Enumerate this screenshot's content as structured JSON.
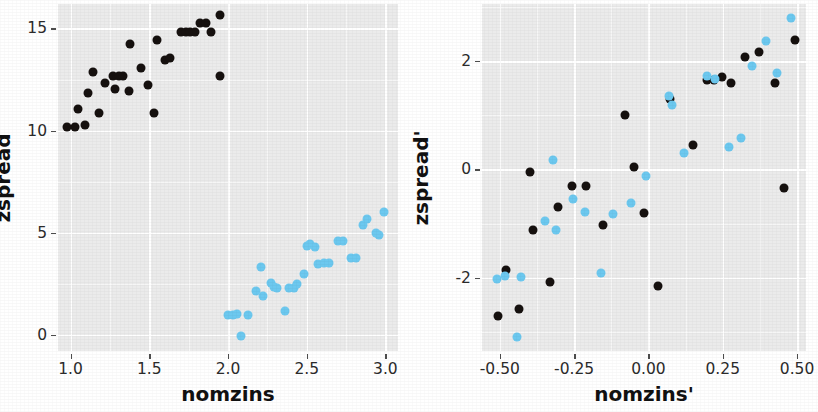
{
  "figure": {
    "background": "#ffffff",
    "panel_background": "#ebebeb",
    "grid_color": "#ffffff",
    "black_series_color": "#16110f",
    "blue_series_color": "#6cc8ef"
  },
  "chart_data": [
    {
      "type": "scatter",
      "title": "",
      "xlabel": "nomzins",
      "ylabel": "zspread",
      "xlim": [
        0.92,
        3.08
      ],
      "ylim": [
        -0.8,
        16.2
      ],
      "xticks": [
        1.0,
        1.5,
        2.0,
        2.5,
        3.0
      ],
      "xticklabels": [
        "1.0",
        "1.5",
        "2.0",
        "2.5",
        "3.0"
      ],
      "yticks": [
        0,
        5,
        10,
        15
      ],
      "yticklabels": [
        "0",
        "5",
        "10",
        "15"
      ],
      "grid": true,
      "legend": "none",
      "series": [
        {
          "name": "black-group",
          "color": "#16110f",
          "points": [
            [
              0.98,
              10.15
            ],
            [
              1.03,
              10.15
            ],
            [
              1.09,
              10.25
            ],
            [
              1.05,
              11.05
            ],
            [
              1.14,
              12.85
            ],
            [
              1.11,
              11.85
            ],
            [
              1.18,
              10.85
            ],
            [
              1.22,
              12.35
            ],
            [
              1.27,
              12.65
            ],
            [
              1.31,
              12.65
            ],
            [
              1.33,
              12.65
            ],
            [
              1.28,
              12.05
            ],
            [
              1.38,
              14.25
            ],
            [
              1.37,
              11.95
            ],
            [
              1.45,
              13.05
            ],
            [
              1.49,
              12.25
            ],
            [
              1.53,
              10.85
            ],
            [
              1.55,
              14.45
            ],
            [
              1.6,
              13.45
            ],
            [
              1.63,
              13.55
            ],
            [
              1.7,
              14.85
            ],
            [
              1.73,
              14.85
            ],
            [
              1.76,
              14.85
            ],
            [
              1.79,
              14.85
            ],
            [
              1.82,
              15.25
            ],
            [
              1.86,
              15.25
            ],
            [
              1.89,
              14.85
            ],
            [
              1.95,
              15.65
            ],
            [
              1.95,
              12.65
            ]
          ]
        },
        {
          "name": "blue-group",
          "color": "#6cc8ef",
          "points": [
            [
              2.0,
              0.95
            ],
            [
              2.03,
              0.95
            ],
            [
              2.06,
              1.0
            ],
            [
              2.08,
              -0.05
            ],
            [
              2.13,
              0.95
            ],
            [
              2.18,
              2.15
            ],
            [
              2.21,
              3.3
            ],
            [
              2.22,
              1.9
            ],
            [
              2.27,
              2.55
            ],
            [
              2.29,
              2.35
            ],
            [
              2.31,
              2.3
            ],
            [
              2.36,
              1.15
            ],
            [
              2.39,
              2.3
            ],
            [
              2.42,
              2.3
            ],
            [
              2.44,
              2.5
            ],
            [
              2.48,
              2.95
            ],
            [
              2.5,
              4.35
            ],
            [
              2.52,
              4.45
            ],
            [
              2.55,
              4.3
            ],
            [
              2.57,
              3.45
            ],
            [
              2.61,
              3.5
            ],
            [
              2.64,
              3.5
            ],
            [
              2.7,
              4.6
            ],
            [
              2.73,
              4.6
            ],
            [
              2.78,
              3.75
            ],
            [
              2.81,
              3.75
            ],
            [
              2.86,
              5.35
            ],
            [
              2.88,
              5.65
            ],
            [
              2.94,
              5.0
            ],
            [
              2.96,
              4.9
            ],
            [
              2.99,
              6.0
            ]
          ]
        }
      ]
    },
    {
      "type": "scatter",
      "title": "",
      "xlabel": "nomzins'",
      "ylabel": "zspread'",
      "xlim": [
        -0.56,
        0.53
      ],
      "ylim": [
        -3.35,
        3.05
      ],
      "xticks": [
        -0.5,
        -0.25,
        0.0,
        0.25,
        0.5
      ],
      "xticklabels": [
        "-0.50",
        "-0.25",
        "0.00",
        "0.25",
        "0.50"
      ],
      "yticks": [
        -2,
        0,
        2
      ],
      "yticklabels": [
        "-2",
        "0",
        "2"
      ],
      "grid": true,
      "legend": "none",
      "series": [
        {
          "name": "black-group",
          "color": "#16110f",
          "points": [
            [
              -0.505,
              -2.7
            ],
            [
              -0.478,
              -1.85
            ],
            [
              -0.437,
              -2.58
            ],
            [
              -0.398,
              -0.05
            ],
            [
              -0.39,
              -1.12
            ],
            [
              -0.33,
              -2.08
            ],
            [
              -0.305,
              -0.7
            ],
            [
              -0.258,
              -0.3
            ],
            [
              -0.21,
              -0.3
            ],
            [
              -0.153,
              -1.02
            ],
            [
              -0.078,
              1.0
            ],
            [
              -0.047,
              0.05
            ],
            [
              -0.015,
              -0.8
            ],
            [
              0.032,
              -2.16
            ],
            [
              0.072,
              1.3
            ],
            [
              0.15,
              0.45
            ],
            [
              0.196,
              1.64
            ],
            [
              0.222,
              1.64
            ],
            [
              0.248,
              1.7
            ],
            [
              0.278,
              1.6
            ],
            [
              0.325,
              2.08
            ],
            [
              0.372,
              2.16
            ],
            [
              0.425,
              1.6
            ],
            [
              0.455,
              -0.35
            ],
            [
              0.492,
              2.38
            ]
          ]
        },
        {
          "name": "blue-group",
          "color": "#6cc8ef",
          "points": [
            [
              -0.51,
              -2.02
            ],
            [
              -0.483,
              -1.96
            ],
            [
              -0.442,
              -3.1
            ],
            [
              -0.428,
              -1.98
            ],
            [
              -0.348,
              -0.95
            ],
            [
              -0.322,
              0.18
            ],
            [
              -0.312,
              -1.12
            ],
            [
              -0.255,
              -0.55
            ],
            [
              -0.215,
              -0.78
            ],
            [
              -0.16,
              -1.92
            ],
            [
              -0.118,
              -0.82
            ],
            [
              -0.06,
              -0.62
            ],
            [
              -0.008,
              -0.12
            ],
            [
              0.07,
              1.36
            ],
            [
              0.08,
              1.18
            ],
            [
              0.118,
              0.3
            ],
            [
              0.198,
              1.72
            ],
            [
              0.225,
              1.66
            ],
            [
              0.272,
              0.42
            ],
            [
              0.312,
              0.58
            ],
            [
              0.348,
              1.9
            ],
            [
              0.395,
              2.36
            ],
            [
              0.432,
              1.78
            ],
            [
              0.478,
              2.8
            ]
          ]
        }
      ]
    }
  ]
}
